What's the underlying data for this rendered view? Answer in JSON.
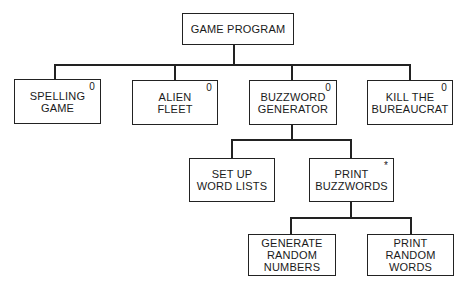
{
  "diagram": {
    "type": "hierarchy chart",
    "root": {
      "id": "game-program",
      "label": "GAME PROGRAM",
      "marker": ""
    },
    "nodes": {
      "spelling_game": {
        "label": "SPELLING\nGAME",
        "marker": "0"
      },
      "alien_fleet": {
        "label": "ALIEN\nFLEET",
        "marker": "0"
      },
      "buzzword_generator": {
        "label": "BUZZWORD\nGENERATOR",
        "marker": "0"
      },
      "kill_the_bureaucrat": {
        "label": "KILL THE\nBUREAUCRAT",
        "marker": "0"
      },
      "set_up_word_lists": {
        "label": "SET UP\nWORD LISTS",
        "marker": ""
      },
      "print_buzzwords": {
        "label": "PRINT\nBUZZWORDS",
        "marker": "*"
      },
      "generate_random_numbers": {
        "label": "GENERATE\nRANDOM\nNUMBERS",
        "marker": ""
      },
      "print_random_words": {
        "label": "PRINT\nRANDOM\nWORDS",
        "marker": ""
      }
    },
    "edges": [
      [
        "GAME PROGRAM",
        "SPELLING GAME"
      ],
      [
        "GAME PROGRAM",
        "ALIEN FLEET"
      ],
      [
        "GAME PROGRAM",
        "BUZZWORD GENERATOR"
      ],
      [
        "GAME PROGRAM",
        "KILL THE BUREAUCRAT"
      ],
      [
        "BUZZWORD GENERATOR",
        "SET UP WORD LISTS"
      ],
      [
        "BUZZWORD GENERATOR",
        "PRINT BUZZWORDS"
      ],
      [
        "PRINT BUZZWORDS",
        "GENERATE RANDOM NUMBERS"
      ],
      [
        "PRINT BUZZWORDS",
        "PRINT RANDOM WORDS"
      ]
    ],
    "colors": {
      "line": "#222222",
      "background": "#ffffff",
      "text": "#1a1a1a"
    }
  }
}
